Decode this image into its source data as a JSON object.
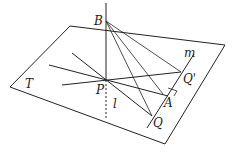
{
  "diagram": {
    "type": "geometry-3d-plane",
    "labels": {
      "B": "B",
      "m": "m",
      "Qp": "Q'",
      "T": "T",
      "P": "P",
      "A": "A",
      "l": "l",
      "Q": "Q"
    },
    "colors": {
      "line": "#222222",
      "background": "#ffffff"
    }
  }
}
